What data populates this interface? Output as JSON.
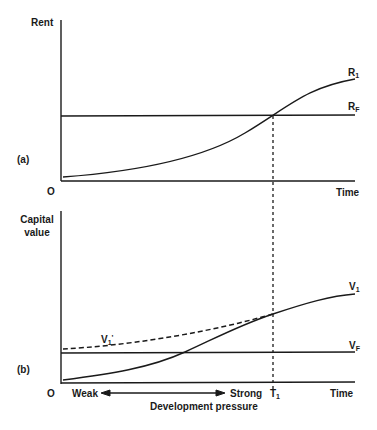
{
  "panel_a": {
    "tag": "(a)",
    "y_axis_label": "Rent",
    "origin_label": "O",
    "x_axis_label": "Time",
    "curves": [
      {
        "name": "R",
        "sub": "1",
        "type": "rising curve"
      },
      {
        "name": "R",
        "sub": "F",
        "type": "horizontal line"
      }
    ]
  },
  "panel_b": {
    "tag": "(b)",
    "y_axis_label_line1": "Capital",
    "y_axis_label_line2": "value",
    "origin_label": "O",
    "x_axis_label": "Time",
    "time_marker": {
      "name": "T",
      "sub": "1"
    },
    "curves": [
      {
        "name": "V",
        "sub": "1",
        "type": "rising curve"
      },
      {
        "name": "V",
        "sub": "F",
        "type": "horizontal line"
      },
      {
        "name": "V",
        "sub": "1",
        "prime": "'",
        "type": "dashed curve"
      }
    ],
    "pressure_axis": {
      "left": "Weak",
      "right": "Strong",
      "caption": "Development pressure"
    }
  },
  "colors": {
    "ink": "#1a1a1a",
    "background": "#ffffff"
  }
}
